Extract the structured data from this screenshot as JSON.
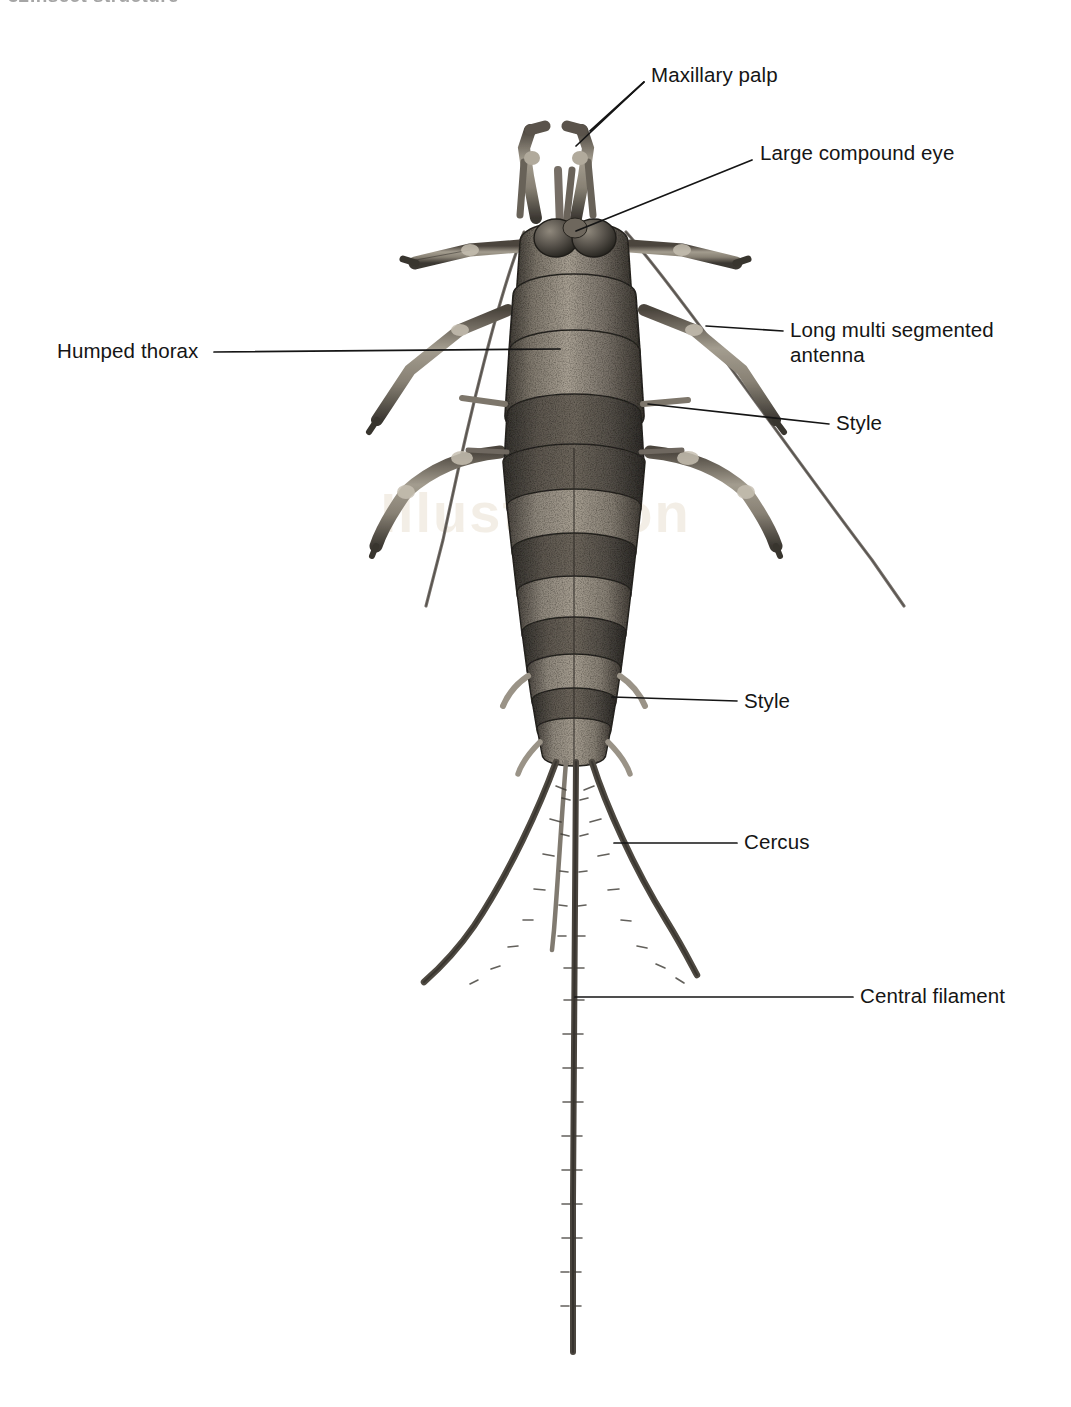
{
  "page": {
    "running_header_number": "32",
    "running_header_text": "Insect structure",
    "watermark": "Illustration",
    "background_color": "#ffffff",
    "ink_color": "#151515"
  },
  "figure": {
    "name": "bristletail-dorsal-view",
    "drawing_style": "stipple-engraving halftone",
    "body_color": "#555049",
    "highlight_color": "#b9b2a6",
    "outline_color": "#2d2a26"
  },
  "labels": [
    {
      "id": "maxillary-palp",
      "text": "Maxillary palp",
      "x": 651,
      "y": 62,
      "align": "left",
      "leader": [
        [
          644,
          82
        ],
        [
          593,
          129
        ]
      ],
      "leader2": [
        [
          644,
          82
        ],
        [
          578,
          143
        ]
      ]
    },
    {
      "id": "large-compound-eye",
      "text": "Large compound eye",
      "x": 760,
      "y": 140,
      "align": "left",
      "leader": [
        [
          752,
          160
        ],
        [
          574,
          229
        ]
      ]
    },
    {
      "id": "humped-thorax",
      "text": "Humped thorax",
      "x": 57,
      "y": 338,
      "align": "left",
      "leader": [
        [
          214,
          352
        ],
        [
          560,
          349
        ]
      ]
    },
    {
      "id": "long-multi-segmented-antenna",
      "text": "Long multi segmented\nantenna",
      "x": 790,
      "y": 317,
      "align": "left",
      "leader": [
        [
          783,
          331
        ],
        [
          712,
          327
        ]
      ]
    },
    {
      "id": "style-thoracic",
      "text": "Style",
      "x": 836,
      "y": 410,
      "align": "left",
      "leader": [
        [
          829,
          424
        ],
        [
          646,
          404
        ]
      ]
    },
    {
      "id": "style-abdominal",
      "text": "Style",
      "x": 744,
      "y": 688,
      "align": "left",
      "leader": [
        [
          737,
          701
        ],
        [
          614,
          697
        ]
      ]
    },
    {
      "id": "cercus",
      "text": "Cercus",
      "x": 744,
      "y": 829,
      "align": "left",
      "leader": [
        [
          737,
          843
        ],
        [
          616,
          843
        ]
      ]
    },
    {
      "id": "central-filament",
      "text": "Central filament",
      "x": 860,
      "y": 983,
      "align": "left",
      "leader": [
        [
          853,
          997
        ],
        [
          574,
          997
        ]
      ]
    }
  ],
  "anatomy": {
    "antennae": [
      {
        "id": "antenna-left",
        "from": [
          520,
          228
        ],
        "to": [
          425,
          607
        ]
      },
      {
        "id": "antenna-right",
        "from": [
          628,
          228
        ],
        "to": [
          905,
          607
        ]
      }
    ],
    "filaments": [
      {
        "id": "cercus-left",
        "tip": [
          424,
          982
        ]
      },
      {
        "id": "cercus-right",
        "tip": [
          697,
          975
        ]
      },
      {
        "id": "central-filament",
        "tip": [
          573,
          1352
        ]
      },
      {
        "id": "accessory-filament",
        "tip": [
          552,
          950
        ]
      }
    ],
    "segment_count_abdomen": 9,
    "leg_pairs": 3
  }
}
